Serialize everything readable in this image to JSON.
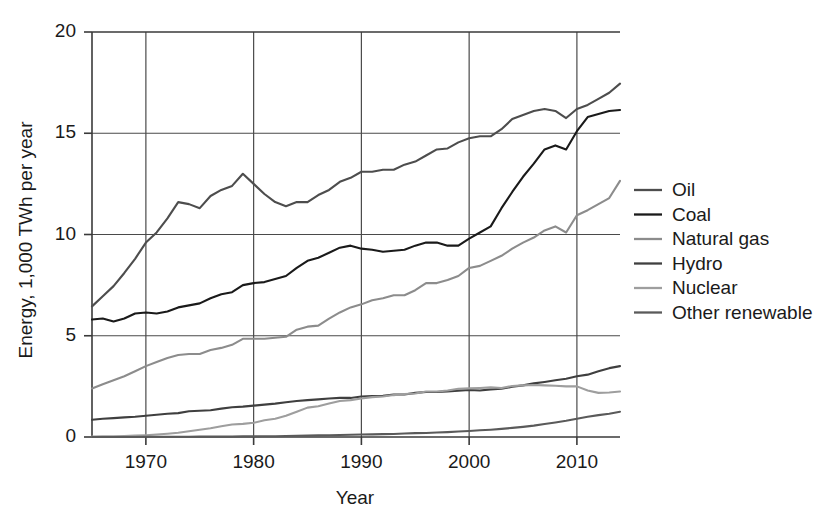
{
  "chart_data": {
    "type": "line",
    "title": "",
    "xlabel": "Year",
    "ylabel": "Energy, 1,000 TWh per year",
    "xlim": [
      1965,
      2014
    ],
    "ylim": [
      0,
      20
    ],
    "xticks": [
      1970,
      1980,
      1990,
      2000,
      2010
    ],
    "yticks": [
      0,
      5,
      10,
      15,
      20
    ],
    "xtick_labels": [
      "1970",
      "1980",
      "1990",
      "2000",
      "2010"
    ],
    "ytick_labels": [
      "0",
      "5",
      "10",
      "15",
      "20"
    ],
    "grid": true,
    "legend_position": "right",
    "x": [
      1965,
      1966,
      1967,
      1968,
      1969,
      1970,
      1971,
      1972,
      1973,
      1974,
      1975,
      1976,
      1977,
      1978,
      1979,
      1980,
      1981,
      1982,
      1983,
      1984,
      1985,
      1986,
      1987,
      1988,
      1989,
      1990,
      1991,
      1992,
      1993,
      1994,
      1995,
      1996,
      1997,
      1998,
      1999,
      2000,
      2001,
      2002,
      2003,
      2004,
      2005,
      2006,
      2007,
      2008,
      2009,
      2010,
      2011,
      2012,
      2013,
      2014
    ],
    "series": [
      {
        "name": "Oil",
        "color": "#4d4d4d",
        "values": [
          6.45,
          6.95,
          7.45,
          8.1,
          8.8,
          9.6,
          10.1,
          10.8,
          11.6,
          11.5,
          11.3,
          11.9,
          12.2,
          12.4,
          13.0,
          12.5,
          12.0,
          11.6,
          11.4,
          11.6,
          11.6,
          11.95,
          12.2,
          12.6,
          12.8,
          13.1,
          13.1,
          13.2,
          13.2,
          13.45,
          13.6,
          13.9,
          14.2,
          14.25,
          14.55,
          14.75,
          14.85,
          14.85,
          15.2,
          15.7,
          15.9,
          16.1,
          16.2,
          16.1,
          15.75,
          16.2,
          16.4,
          16.7,
          17.0,
          17.45
        ]
      },
      {
        "name": "Coal",
        "color": "#1a1a1a",
        "values": [
          5.8,
          5.85,
          5.7,
          5.85,
          6.1,
          6.15,
          6.1,
          6.2,
          6.4,
          6.5,
          6.6,
          6.85,
          7.05,
          7.15,
          7.5,
          7.6,
          7.65,
          7.8,
          7.95,
          8.35,
          8.7,
          8.85,
          9.1,
          9.35,
          9.45,
          9.3,
          9.25,
          9.15,
          9.2,
          9.25,
          9.45,
          9.6,
          9.6,
          9.45,
          9.45,
          9.8,
          10.1,
          10.4,
          11.3,
          12.1,
          12.85,
          13.5,
          14.2,
          14.4,
          14.2,
          15.1,
          15.8,
          15.95,
          16.1,
          16.15
        ]
      },
      {
        "name": "Natural gas",
        "color": "#8c8c8c",
        "values": [
          2.4,
          2.6,
          2.8,
          3.0,
          3.25,
          3.5,
          3.7,
          3.9,
          4.05,
          4.1,
          4.1,
          4.3,
          4.4,
          4.55,
          4.85,
          4.85,
          4.85,
          4.9,
          4.95,
          5.3,
          5.45,
          5.5,
          5.85,
          6.15,
          6.4,
          6.55,
          6.75,
          6.85,
          7.0,
          7.0,
          7.25,
          7.6,
          7.6,
          7.75,
          7.95,
          8.35,
          8.45,
          8.7,
          8.95,
          9.3,
          9.6,
          9.85,
          10.2,
          10.4,
          10.1,
          10.95,
          11.2,
          11.5,
          11.8,
          12.65
        ]
      },
      {
        "name": "Hydro",
        "color": "#3f3f3f",
        "values": [
          0.85,
          0.9,
          0.93,
          0.97,
          1.0,
          1.05,
          1.1,
          1.15,
          1.18,
          1.27,
          1.3,
          1.32,
          1.4,
          1.47,
          1.5,
          1.55,
          1.6,
          1.65,
          1.72,
          1.78,
          1.82,
          1.86,
          1.9,
          1.93,
          1.93,
          2.0,
          2.02,
          2.03,
          2.1,
          2.1,
          2.18,
          2.22,
          2.22,
          2.25,
          2.29,
          2.32,
          2.3,
          2.35,
          2.38,
          2.48,
          2.55,
          2.65,
          2.72,
          2.8,
          2.88,
          3.0,
          3.08,
          3.25,
          3.4,
          3.5
        ]
      },
      {
        "name": "Nuclear",
        "color": "#9e9e9e",
        "values": [
          0.02,
          0.03,
          0.04,
          0.05,
          0.07,
          0.09,
          0.12,
          0.16,
          0.21,
          0.28,
          0.36,
          0.43,
          0.53,
          0.62,
          0.65,
          0.7,
          0.83,
          0.9,
          1.05,
          1.25,
          1.45,
          1.52,
          1.65,
          1.78,
          1.82,
          1.9,
          1.97,
          2.0,
          2.07,
          2.12,
          2.15,
          2.25,
          2.25,
          2.3,
          2.38,
          2.4,
          2.42,
          2.45,
          2.42,
          2.52,
          2.55,
          2.57,
          2.55,
          2.53,
          2.5,
          2.5,
          2.3,
          2.18,
          2.2,
          2.25
        ]
      },
      {
        "name": "Other renewable",
        "color": "#5a5a5a",
        "values": [
          0.0,
          0.0,
          0.0,
          0.0,
          0.0,
          0.01,
          0.01,
          0.01,
          0.01,
          0.01,
          0.02,
          0.02,
          0.02,
          0.02,
          0.03,
          0.03,
          0.04,
          0.04,
          0.05,
          0.06,
          0.07,
          0.08,
          0.09,
          0.1,
          0.11,
          0.12,
          0.13,
          0.14,
          0.15,
          0.17,
          0.19,
          0.2,
          0.22,
          0.24,
          0.27,
          0.3,
          0.33,
          0.36,
          0.4,
          0.45,
          0.5,
          0.56,
          0.64,
          0.72,
          0.8,
          0.9,
          1.0,
          1.08,
          1.15,
          1.25
        ]
      }
    ]
  }
}
